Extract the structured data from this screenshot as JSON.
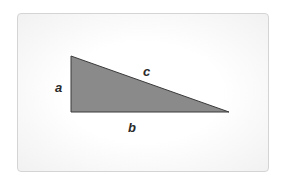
{
  "diagram": {
    "type": "right-triangle",
    "labels": {
      "vertical_leg": "a",
      "horizontal_leg": "b",
      "hypotenuse": "c"
    },
    "colors": {
      "fill": "#8a8a8a",
      "stroke": "#3a3a3a",
      "card_border": "#d4d4d4"
    }
  }
}
